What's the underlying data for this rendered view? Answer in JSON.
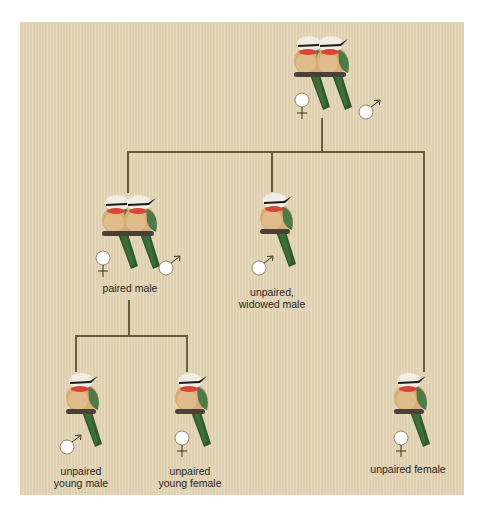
{
  "diagram": {
    "type": "family-tree",
    "colors": {
      "background": "#e3d5b5",
      "connector": "#6b5a3c",
      "label_text": "#2b2620",
      "bird_body": "#d8ad78",
      "bird_throat": "#d9443a",
      "bird_crown": "#f2ede2",
      "bird_eye_stripe": "#1a1a1a",
      "bird_wing": "#4f7a46",
      "bird_tail": "#2f5a2e",
      "perch": "#4a4038",
      "sex_symbol_fill": "#ffffff"
    },
    "nodes": [
      {
        "id": "parents",
        "label": "",
        "birds": 2,
        "symbols": [
          "female",
          "male"
        ]
      },
      {
        "id": "paired-male",
        "label": "paired male",
        "birds": 2,
        "symbols": [
          "female",
          "male"
        ]
      },
      {
        "id": "widowed-male",
        "label_line1": "unpaired,",
        "label_line2": "widowed male",
        "birds": 1,
        "symbols": [
          "male"
        ]
      },
      {
        "id": "young-male",
        "label_line1": "unpaired",
        "label_line2": "young male",
        "birds": 1,
        "symbols": [
          "male"
        ]
      },
      {
        "id": "young-female",
        "label_line1": "unpaired",
        "label_line2": "young female",
        "birds": 1,
        "symbols": [
          "female"
        ]
      },
      {
        "id": "unpaired-female",
        "label": "unpaired female",
        "birds": 1,
        "symbols": [
          "female"
        ]
      }
    ],
    "edges": [
      [
        "parents",
        "paired-male"
      ],
      [
        "parents",
        "widowed-male"
      ],
      [
        "parents",
        "unpaired-female"
      ],
      [
        "paired-male",
        "young-male"
      ],
      [
        "paired-male",
        "young-female"
      ]
    ]
  }
}
